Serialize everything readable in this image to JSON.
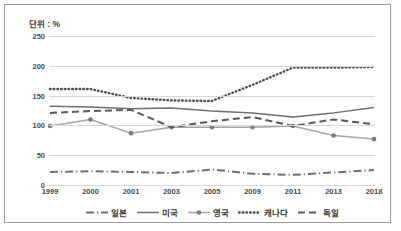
{
  "chart_data": {
    "type": "line",
    "title": "단위 : %",
    "xlabel": "",
    "ylabel": "",
    "ylim": [
      0,
      250
    ],
    "yticks": [
      0,
      50,
      100,
      150,
      200,
      250
    ],
    "grid": true,
    "legend_position": "bottom",
    "categories": [
      "1999",
      "2000",
      "2001",
      "2003",
      "2005",
      "2009",
      "2011",
      "2013",
      "2018"
    ],
    "series": [
      {
        "name": "일본",
        "style": "dash-dot",
        "color": "#6e6e6e",
        "values": [
          22,
          23,
          22,
          20,
          26,
          19,
          17,
          21,
          25
        ]
      },
      {
        "name": "미국",
        "style": "solid",
        "color": "#6e6e6e",
        "values": [
          132,
          131,
          128,
          129,
          124,
          121,
          114,
          121,
          130
        ]
      },
      {
        "name": "영국",
        "style": "solid-marker",
        "color": "#a6a6a6",
        "values": [
          99,
          110,
          87,
          97,
          97,
          97,
          99,
          83,
          77
        ]
      },
      {
        "name": "캐나다",
        "style": "dotted",
        "color": "#4d4d4d",
        "values": [
          161,
          161,
          146,
          142,
          141,
          168,
          197,
          197,
          198
        ]
      },
      {
        "name": "독일",
        "style": "dashed",
        "color": "#5a5a5a",
        "values": [
          121,
          124,
          126,
          97,
          107,
          114,
          99,
          110,
          102
        ]
      }
    ]
  },
  "legend": {
    "items": [
      {
        "label": "일본",
        "style": "dash-dot"
      },
      {
        "label": "미국",
        "style": "solid"
      },
      {
        "label": "영국",
        "style": "solid-marker"
      },
      {
        "label": "캐나다",
        "style": "dotted"
      },
      {
        "label": "독일",
        "style": "dashed"
      }
    ]
  },
  "colors": {
    "frame": "#9a9a9a",
    "grid": "#d9d9d9",
    "text": "#4a4a4a",
    "background": "#ffffff"
  }
}
